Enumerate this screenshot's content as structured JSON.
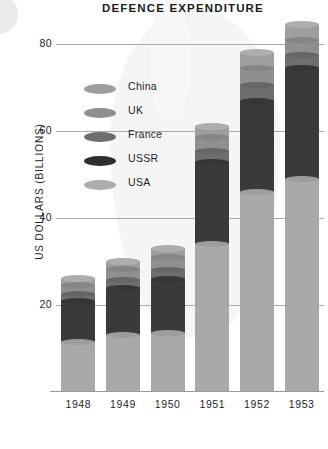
{
  "chart_data": {
    "type": "bar",
    "subtype": "stacked-column",
    "title": "DEFENCE EXPENDITURE",
    "xlabel": "",
    "ylabel": "US DOLLARS (BILLIONS)",
    "categories": [
      "1948",
      "1949",
      "1950",
      "1951",
      "1952",
      "1953"
    ],
    "ylim": [
      0,
      86
    ],
    "yticks": [
      20,
      40,
      60,
      80
    ],
    "ytick_labels": [
      "20",
      "40",
      "60",
      "80"
    ],
    "grid": "horizontal",
    "legend_position": "inside-upper-left",
    "series": [
      {
        "name": "USA",
        "color": "#a9a9a9",
        "values": [
          11.5,
          13.0,
          13.5,
          34.0,
          46.0,
          49.0
        ]
      },
      {
        "name": "USSR",
        "color": "#3a3a3a",
        "values": [
          9.5,
          11.0,
          12.5,
          19.0,
          21.0,
          25.5
        ]
      },
      {
        "name": "France",
        "color": "#6e6e6e",
        "values": [
          1.6,
          1.8,
          2.0,
          2.5,
          3.5,
          3.0
        ]
      },
      {
        "name": "UK",
        "color": "#8f8f8f",
        "values": [
          2.0,
          2.6,
          3.0,
          3.2,
          4.0,
          3.5
        ]
      },
      {
        "name": "China",
        "color": "#9e9e9e",
        "values": [
          1.4,
          1.6,
          2.0,
          2.3,
          3.5,
          3.5
        ]
      }
    ],
    "totals": [
      26.0,
      30.0,
      33.0,
      61.0,
      78.0,
      84.5
    ],
    "stack_order_bottom_to_top": [
      "USA",
      "USSR",
      "France",
      "UK",
      "China"
    ],
    "legend_entries": [
      {
        "label": "China",
        "color": "#9e9e9e"
      },
      {
        "label": "UK",
        "color": "#8f8f8f"
      },
      {
        "label": "France",
        "color": "#6e6e6e"
      },
      {
        "label": "USSR",
        "color": "#2e2e2e"
      },
      {
        "label": "USA",
        "color": "#adadad"
      }
    ]
  }
}
